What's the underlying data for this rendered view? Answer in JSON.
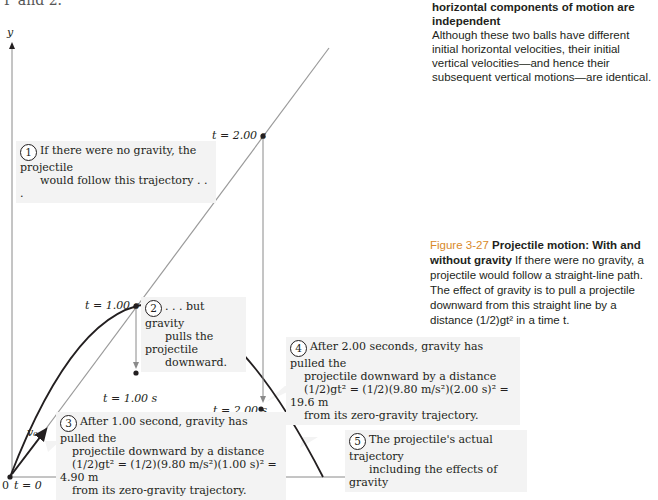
{
  "page": {
    "top_fragment": "P and 2.",
    "side_heading": {
      "bold": "horizontal components of motion are independent",
      "text": "Although these two balls have different initial horizontal velocities, their initial vertical velocities—and hence their subsequent vertical motions—are identical."
    },
    "caption": {
      "figure_number": "Figure 3-27",
      "title": "Projectile motion: With and without gravity",
      "text": "If there were no gravity, a projectile would follow a straight-line path. The effect of gravity is to pull a projectile downward from this straight line by a distance (1/2)gt² in a time t."
    }
  },
  "diagram": {
    "axes": {
      "x_label": "x",
      "y_label": "y",
      "origin_label": "0",
      "origin_time": "t = 0",
      "velocity_label": "v₀"
    },
    "time_labels": {
      "straight_1s": "t = 1.00 s",
      "straight_2s": "t = 2.00 s",
      "curve_1s": "t = 1.00 s",
      "curve_2s": "t = 2.00 s"
    },
    "callouts": [
      {
        "num": "1",
        "lines": [
          "If there were no gravity, the projectile",
          "would follow this trajectory . . ."
        ]
      },
      {
        "num": "2",
        "lines": [
          ". . . but gravity",
          "pulls the projectile",
          "downward."
        ]
      },
      {
        "num": "3",
        "lines": [
          "After 1.00 second, gravity has pulled the",
          "projectile downward by a distance",
          "(1/2)gt² = (1/2)(9.80 m/s²)(1.00 s)² = 4.90 m",
          "from its zero-gravity trajectory."
        ]
      },
      {
        "num": "4",
        "lines": [
          "After 2.00 seconds, gravity has pulled the",
          "projectile downward by a distance",
          "(1/2)gt² = (1/2)(9.80 m/s²)(2.00 s)² = 19.6 m",
          "from its zero-gravity trajectory."
        ]
      },
      {
        "num": "5",
        "lines": [
          "The projectile's actual trajectory",
          "including the effects of gravity"
        ]
      }
    ],
    "colors": {
      "straight_line": "#9a9a9a",
      "trajectory": "#231f20",
      "callout_bg": "#f3f3f3",
      "figure_number": "#d98a2a"
    }
  }
}
